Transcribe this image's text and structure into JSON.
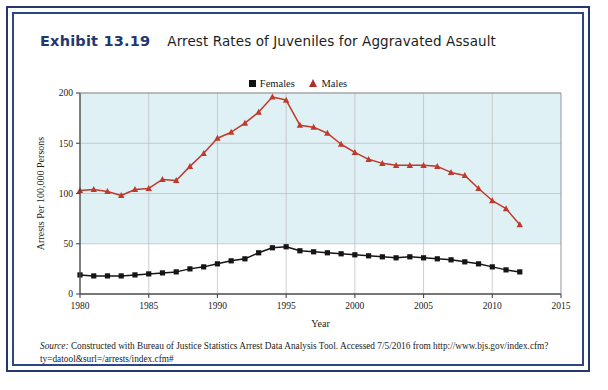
{
  "exhibit": {
    "number": "Exhibit 13.19",
    "caption": "Arrest Rates of Juveniles for Aggravated Assault"
  },
  "legend": {
    "entries": [
      {
        "label": "Females",
        "marker": "square-marker",
        "color": "#111111"
      },
      {
        "label": "Males",
        "marker": "triangle-marker",
        "color": "#b03025"
      }
    ]
  },
  "source": {
    "label": "Source:",
    "text": " Constructed with Bureau of Justice Statistics Arrest Data Analysis Tool. Accessed 7/5/2016 from http://www.bjs.gov/index.cfm?ty=datool&surl=/arrests/index.cfm#"
  },
  "axes": {
    "x_title": "Year",
    "y_title": "Arrests Per 100,000 Persons",
    "x_ticks": [
      "1980",
      "1985",
      "1990",
      "1995",
      "2000",
      "2005",
      "2010",
      "2015"
    ],
    "y_ticks": [
      "0",
      "50",
      "100",
      "150",
      "200"
    ]
  },
  "colors": {
    "frame_outer": "#22386e",
    "frame_inner": "#2c4684",
    "plot_fill": "#e0f1f5",
    "males": "#c0392b",
    "females": "#151515",
    "heading": "#21386f"
  },
  "chart_data": {
    "type": "line",
    "title": "Arrest Rates of Juveniles for Aggravated Assault",
    "xlabel": "Year",
    "ylabel": "Arrests Per 100,000 Persons",
    "xlim": [
      1980,
      2015
    ],
    "ylim": [
      0,
      200
    ],
    "grid": true,
    "legend_position": "top-center",
    "x": [
      1980,
      1981,
      1982,
      1983,
      1984,
      1985,
      1986,
      1987,
      1988,
      1989,
      1990,
      1991,
      1992,
      1993,
      1994,
      1995,
      1996,
      1997,
      1998,
      1999,
      2000,
      2001,
      2002,
      2003,
      2004,
      2005,
      2006,
      2007,
      2008,
      2009,
      2010,
      2011,
      2012
    ],
    "series": [
      {
        "name": "Males",
        "color": "#c0392b",
        "marker": "triangle",
        "values": [
          103,
          104,
          102,
          98,
          104,
          105,
          114,
          113,
          127,
          140,
          155,
          161,
          170,
          181,
          196,
          193,
          168,
          166,
          160,
          149,
          141,
          134,
          130,
          128,
          128,
          128,
          127,
          121,
          118,
          105,
          93,
          85,
          69
        ]
      },
      {
        "name": "Females",
        "color": "#151515",
        "marker": "square",
        "values": [
          19,
          18,
          18,
          18,
          19,
          20,
          21,
          22,
          25,
          27,
          30,
          33,
          35,
          41,
          46,
          47,
          43,
          42,
          41,
          40,
          39,
          38,
          37,
          36,
          37,
          36,
          35,
          34,
          32,
          30,
          27,
          24,
          22
        ]
      }
    ]
  }
}
